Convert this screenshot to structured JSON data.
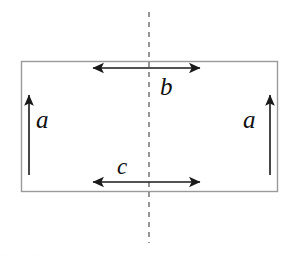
{
  "figure": {
    "type": "geometry-diagram",
    "background_color": "#ffffff",
    "stroke_color": "#1a1a1a",
    "rectangle_stroke_color": "#9a9a9a",
    "dash_color": "#8c8c8c",
    "rectangle": {
      "name": "outer-rectangle",
      "x": 21,
      "y": 61,
      "width": 257,
      "height": 131,
      "stroke_width": 1
    },
    "axis": {
      "name": "symmetry-axis",
      "orientation": "vertical",
      "x": 149,
      "y_start": 12,
      "y_end": 243,
      "style": "dashed",
      "dash_pattern": "5 5"
    },
    "arrows": [
      {
        "id": "arrow-b",
        "label": "b",
        "orientation": "horizontal",
        "heads": "both",
        "x1": 91,
        "x2": 202,
        "y": 68,
        "length": 111
      },
      {
        "id": "arrow-c",
        "label": "c",
        "orientation": "horizontal",
        "heads": "both",
        "x1": 91,
        "x2": 202,
        "y": 182,
        "length": 111
      },
      {
        "id": "arrow-a-left",
        "label": "a",
        "orientation": "vertical",
        "heads": "up",
        "x": 29,
        "y1": 175,
        "y2": 93,
        "length": 82
      },
      {
        "id": "arrow-a-right",
        "label": "a",
        "orientation": "vertical",
        "heads": "up",
        "x": 270,
        "y1": 175,
        "y2": 93,
        "length": 82
      }
    ],
    "labels": {
      "b": "b",
      "c": "c",
      "a_left": "a",
      "a_right": "a"
    },
    "bottom_artifact": "    .      .          .  .         .        .       ."
  }
}
